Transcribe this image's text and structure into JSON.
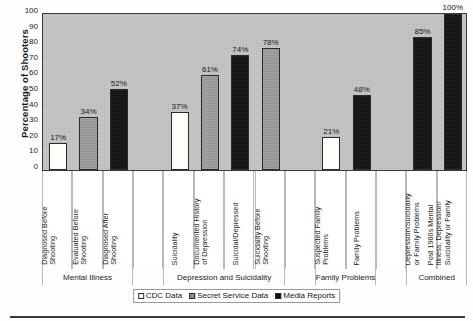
{
  "chart_data": {
    "type": "bar",
    "title": "",
    "xlabel": "",
    "ylabel": "Percentage of Shooters",
    "ylim": [
      0,
      100
    ],
    "yticks": [
      100,
      90,
      80,
      70,
      60,
      50,
      40,
      30,
      20,
      10,
      0
    ],
    "grid": false,
    "legend_position": "bottom-center",
    "legend": [
      {
        "label": "CDC Data",
        "series": "cdc",
        "color": "#ffffff"
      },
      {
        "label": "Secret Service Data",
        "series": "ss",
        "color": "#8f8f8f"
      },
      {
        "label": "Media Reports",
        "series": "media",
        "color": "#111111"
      }
    ],
    "groups": [
      {
        "name": "Mental Illness",
        "bars": [
          {
            "label": "Diagnosed Before Shooting",
            "series": "cdc",
            "value": 17,
            "value_label": "17%"
          },
          {
            "label": "Evaluated Before Shooting",
            "series": "ss",
            "value": 34,
            "value_label": "34%"
          },
          {
            "label": "Diagnosed After Shooting",
            "series": "media",
            "value": 52,
            "value_label": "52%"
          }
        ]
      },
      {
        "name": "Depression and Suicidality",
        "bars": [
          {
            "label": "Suicidality",
            "series": "cdc",
            "value": 37,
            "value_label": "37%"
          },
          {
            "label": "Documented History of Depression",
            "series": "ss",
            "value": 61,
            "value_label": "61%"
          },
          {
            "label": "Suicidal/Depressed",
            "series": "media",
            "value": 74,
            "value_label": "74%"
          },
          {
            "label": "Suicidality Before Shooting",
            "series": "ss",
            "value": 78,
            "value_label": "78%"
          }
        ]
      },
      {
        "name": "Family Problems",
        "bars": [
          {
            "label": "Suspected Family Problems",
            "series": "cdc",
            "value": 21,
            "value_label": "21%"
          },
          {
            "label": "Family Problems",
            "series": "media",
            "value": 48,
            "value_label": "48%"
          }
        ]
      },
      {
        "name": "Combined",
        "bars": [
          {
            "label": "Mental Illness, Depression/Suicidality or Family Problems",
            "series": "media",
            "value": 85,
            "value_label": "85%"
          },
          {
            "label": "Post 1980s Mental Illness, Depression/Suicidality or Family",
            "series": "media",
            "value": 100,
            "value_label": "100%"
          }
        ]
      }
    ],
    "categories": [
      "Diagnosed Before Shooting",
      "Evaluated Before Shooting",
      "Diagnosed After Shooting",
      "Suicidality",
      "Documented History of Depression",
      "Suicidal/Depressed",
      "Suicidality Before Shooting",
      "Suspected Family Problems",
      "Family Problems",
      "Mental Illness, Depression/Suicidality or Family Problems",
      "Post 1980s Mental Illness, Depression/Suicidality or Family"
    ],
    "values": [
      17,
      34,
      52,
      37,
      61,
      74,
      78,
      21,
      48,
      85,
      100
    ]
  },
  "labels": {
    "cat_lines": [
      [
        "Diagnosed Before",
        "Shooting"
      ],
      [
        "Evaluated Before",
        "Shooting"
      ],
      [
        "Diagnosed After",
        "Shooting"
      ],
      [
        "Suicidality"
      ],
      [
        "Documented History",
        "of Depression"
      ],
      [
        "Suicidal/Depressed"
      ],
      [
        "Suicidality Before",
        "Shooting"
      ],
      [
        "Suspected Family",
        "Problems"
      ],
      [
        "Family Problems"
      ],
      [
        "Mental Illness,",
        "Depression/Suicidality",
        "or Family Problems"
      ],
      [
        "Post 1980s Mental",
        "Illness, Depression/",
        "Suicidality or Family"
      ]
    ]
  }
}
